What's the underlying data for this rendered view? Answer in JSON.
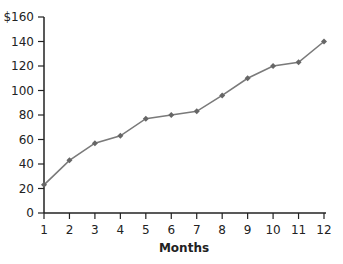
{
  "chart_data": {
    "type": "line",
    "title": "",
    "xlabel": "Months",
    "ylabel": "",
    "x": [
      1,
      2,
      3,
      4,
      5,
      6,
      7,
      8,
      9,
      10,
      11,
      12
    ],
    "series": [
      {
        "name": "Value",
        "values": [
          23,
          43,
          57,
          63,
          77,
          80,
          83,
          96,
          110,
          120,
          123,
          140
        ]
      }
    ],
    "ylim": [
      0,
      160
    ],
    "xlim": [
      1,
      12
    ],
    "y_ticks": [
      0,
      20,
      40,
      60,
      80,
      100,
      120,
      140,
      160
    ],
    "y_tick_labels": [
      "0",
      "20",
      "40",
      "60",
      "80",
      "100",
      "120",
      "140",
      "$160"
    ],
    "x_tick_labels": [
      "1",
      "2",
      "3",
      "4",
      "5",
      "6",
      "7",
      "8",
      "9",
      "10",
      "11",
      "12"
    ],
    "grid": false,
    "legend": "none",
    "colors": {
      "line": "#7a7a7a",
      "marker": "#666666",
      "axis": "#222222"
    }
  }
}
